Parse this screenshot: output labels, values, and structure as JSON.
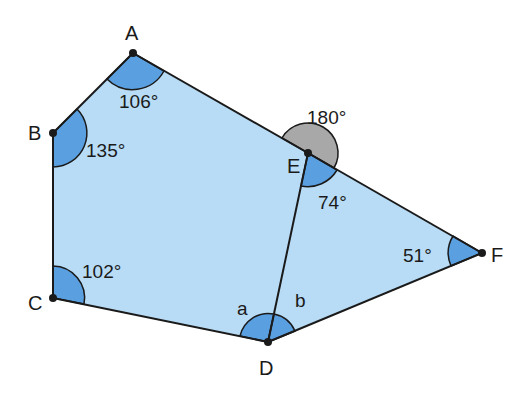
{
  "diagram": {
    "colors": {
      "fill": "#b8dcf5",
      "angle_fill": "#5a9fdf",
      "reflex_fill": "#a8a8a8",
      "stroke": "#1a1a1a"
    },
    "vertices": {
      "A": {
        "label": "A",
        "x": 133,
        "y": 53
      },
      "B": {
        "label": "B",
        "x": 53,
        "y": 133
      },
      "C": {
        "label": "C",
        "x": 53,
        "y": 298
      },
      "D": {
        "label": "D",
        "x": 268,
        "y": 342
      },
      "E": {
        "label": "E",
        "x": 308,
        "y": 153
      },
      "F": {
        "label": "F",
        "x": 482,
        "y": 253
      }
    },
    "angles": {
      "A": "106°",
      "B": "135°",
      "C": "102°",
      "E_reflex": "180°",
      "E_interior": "74°",
      "F": "51°",
      "D_left": "a",
      "D_right": "b"
    },
    "shapes": [
      {
        "name": "pentagon",
        "vertices": [
          "A",
          "E",
          "D",
          "C",
          "B"
        ]
      },
      {
        "name": "triangle",
        "vertices": [
          "E",
          "F",
          "D"
        ]
      }
    ]
  }
}
